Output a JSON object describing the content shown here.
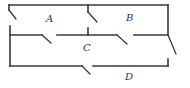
{
  "diagram": {
    "type": "floor-plan",
    "rooms": [
      {
        "id": "A",
        "label": "A"
      },
      {
        "id": "B",
        "label": "B"
      },
      {
        "id": "C",
        "label": "C"
      },
      {
        "id": "D",
        "label": "D"
      }
    ],
    "doors": [
      {
        "id": "door-a-exterior",
        "between": [
          "A",
          "exterior-left"
        ]
      },
      {
        "id": "door-a-b",
        "between": [
          "A",
          "B"
        ]
      },
      {
        "id": "door-a-c",
        "between": [
          "A",
          "C"
        ]
      },
      {
        "id": "door-b-c",
        "between": [
          "B",
          "C"
        ]
      },
      {
        "id": "door-c-exterior",
        "between": [
          "C",
          "exterior-right"
        ]
      },
      {
        "id": "door-c-d",
        "between": [
          "C",
          "D"
        ]
      }
    ],
    "colors": {
      "line": "#3a3a3a",
      "text": "#333333",
      "background": "#ffffff"
    }
  }
}
